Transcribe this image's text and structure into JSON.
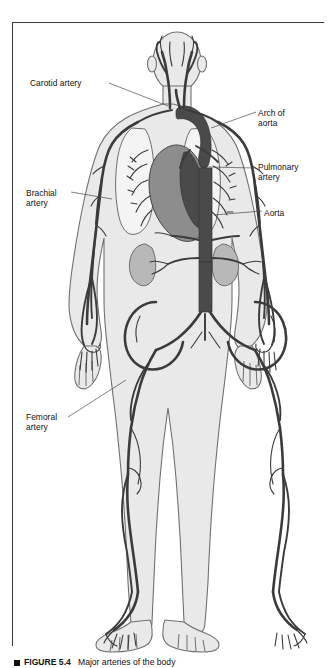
{
  "figure": {
    "title": "Major arteries of the body",
    "figure_number": "FIGURE 5.4",
    "caption_marker": "square-bullet",
    "caption_full": "FIGURE 5.4   Major arteries of the body",
    "type": "anatomical-diagram",
    "view": "anterior-full-body"
  },
  "colors": {
    "artery": "#3b3b3b",
    "artery_fill": "#4a4a4a",
    "body_outline": "#6e6e6e",
    "body_fill": "#e9e9e9",
    "organ_fill": "#c9c9c9",
    "heart_fill": "#8a8a8a",
    "lung_fill": "#f2f2f2",
    "kidney_fill": "#b5b5b5",
    "border": "#3a3a3a",
    "label_text": "#111111",
    "background": "#ffffff"
  },
  "labels": [
    {
      "id": "carotid-artery",
      "text": "Carotid artery",
      "side": "left",
      "x": 30,
      "y": 78,
      "lines": 1
    },
    {
      "id": "brachial-artery",
      "text": "Brachial\nartery",
      "side": "left",
      "x": 26,
      "y": 188,
      "lines": 2
    },
    {
      "id": "femoral-artery",
      "text": "Femoral\nartery",
      "side": "left",
      "x": 26,
      "y": 412,
      "lines": 2
    },
    {
      "id": "arch-of-aorta",
      "text": "Arch of\naorta",
      "side": "right",
      "x": 258,
      "y": 108,
      "lines": 2
    },
    {
      "id": "pulmonary-artery",
      "text": "Pulmonary\nartery",
      "side": "right",
      "x": 258,
      "y": 162,
      "lines": 2
    },
    {
      "id": "aorta",
      "text": "Aorta",
      "side": "right",
      "x": 264,
      "y": 208,
      "lines": 1
    }
  ],
  "leader_lines": [
    {
      "for": "carotid-artery",
      "from": [
        108,
        83
      ],
      "to": [
        162,
        104
      ]
    },
    {
      "for": "brachial-artery",
      "from": [
        72,
        193
      ],
      "to": [
        110,
        198
      ]
    },
    {
      "for": "femoral-artery",
      "from": [
        70,
        417
      ],
      "to": [
        124,
        382
      ]
    },
    {
      "for": "arch-of-aorta",
      "from": [
        256,
        112
      ],
      "to": [
        212,
        128
      ]
    },
    {
      "for": "pulmonary-artery",
      "from": [
        256,
        168
      ],
      "to": [
        206,
        168
      ]
    },
    {
      "for": "aorta",
      "from": [
        262,
        211
      ],
      "to": [
        215,
        214
      ]
    }
  ],
  "anatomy_regions": [
    "head",
    "neck",
    "shoulders",
    "thorax",
    "lungs",
    "heart",
    "abdomen",
    "kidneys",
    "pelvis",
    "arms",
    "hands",
    "thighs",
    "knees",
    "lower-legs",
    "feet"
  ]
}
